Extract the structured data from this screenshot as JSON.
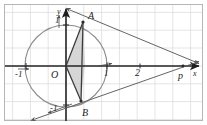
{
  "figure": {
    "type": "geometry-diagram",
    "canvas": {
      "width": 207,
      "height": 125,
      "background": "#ffffff"
    },
    "grid": {
      "visible": true,
      "color": "#d8d8d8",
      "border_color": "#b4b4b4",
      "cell_px": 17.8,
      "origin_px": {
        "x": 66,
        "y": 66
      }
    },
    "axes": {
      "x_label": "x",
      "y_label": "y",
      "color": "#2b2b2b",
      "x_from": {
        "x": 4,
        "y": 66
      },
      "x_to": {
        "x": 203,
        "y": 66
      },
      "y_from": {
        "x": 66,
        "y": 121
      },
      "y_to": {
        "x": 66,
        "y": 7
      }
    },
    "ticks": [
      {
        "name": "x-tick-minus-1",
        "label": "-1",
        "px": {
          "x": 26,
          "y": 66
        },
        "label_px": {
          "x": 19,
          "y": 73
        }
      },
      {
        "name": "x-tick-1",
        "label": "1",
        "px": {
          "x": 107,
          "y": 66
        },
        "label_px": {
          "x": 104,
          "y": 73
        }
      },
      {
        "name": "x-tick-2",
        "label": "2",
        "px": {
          "x": 140,
          "y": 66
        },
        "label_px": {
          "x": 136,
          "y": 72
        }
      },
      {
        "name": "y-tick-1",
        "label": "1",
        "px": {
          "x": 66,
          "y": 25
        },
        "label_px": {
          "x": 57,
          "y": 21
        }
      },
      {
        "name": "y-tick-minus-1",
        "label": "-1",
        "px": {
          "x": 66,
          "y": 105
        },
        "label_px": {
          "x": 54,
          "y": 107
        }
      }
    ],
    "circle": {
      "name": "unit-circle",
      "center_px": {
        "x": 66,
        "y": 66
      },
      "radius_px": 41,
      "color": "#8a8a8a",
      "center_value": [
        0,
        0
      ],
      "radius_value": 1
    },
    "points": [
      {
        "name": "point-A",
        "label": "A",
        "px": {
          "x": 83,
          "y": 22
        },
        "label_px": {
          "x": 88,
          "y": 15
        }
      },
      {
        "name": "point-B",
        "label": "B",
        "px": {
          "x": 80,
          "y": 101
        },
        "label_px": {
          "x": 83,
          "y": 112
        }
      },
      {
        "name": "point-O",
        "label": "O",
        "px": {
          "x": 66,
          "y": 66
        },
        "label_px": {
          "x": 53,
          "y": 76
        }
      },
      {
        "name": "point-P",
        "label": "p",
        "px": {
          "x": 183,
          "y": 66
        },
        "label_px": {
          "x": 180,
          "y": 77
        }
      }
    ],
    "shaded_region": {
      "name": "shaded-quadrilateral",
      "fill": "#bdbdbd",
      "opacity": 0.62,
      "stroke": "#3a3a3a",
      "vertices_px": [
        {
          "x": 83,
          "y": 22
        },
        {
          "x": 84,
          "y": 64
        },
        {
          "x": 81,
          "y": 101
        },
        {
          "x": 66,
          "y": 66
        }
      ]
    },
    "tangent_lines": [
      {
        "name": "tangent-line-A-to-P",
        "from_px": {
          "x": 70,
          "y": 11
        },
        "to_px": {
          "x": 198,
          "y": 64
        },
        "color": "#555555",
        "arrow_ends": "both"
      },
      {
        "name": "tangent-line-B-to-P",
        "from_px": {
          "x": 36,
          "y": 119
        },
        "to_px": {
          "x": 198,
          "y": 62
        },
        "color": "#555555",
        "arrow_ends": "both"
      },
      {
        "name": "radius-segment-OA",
        "from_px": {
          "x": 66,
          "y": 66
        },
        "to_px": {
          "x": 83,
          "y": 22
        },
        "color": "#3a3a3a"
      },
      {
        "name": "radius-segment-OB",
        "from_px": {
          "x": 66,
          "y": 66
        },
        "to_px": {
          "x": 81,
          "y": 101
        },
        "color": "#3a3a3a"
      },
      {
        "name": "chord-segment-AB",
        "from_px": {
          "x": 83,
          "y": 22
        },
        "to_px": {
          "x": 81,
          "y": 101
        },
        "color": "#3a3a3a"
      }
    ]
  }
}
